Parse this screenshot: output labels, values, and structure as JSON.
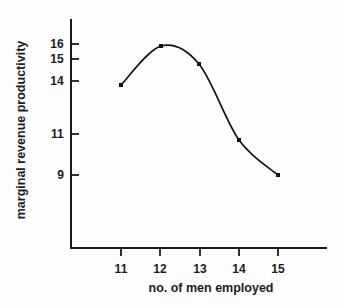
{
  "chart_data": {
    "type": "line",
    "title": "",
    "xlabel": "no. of men employed",
    "ylabel": "marginal revenue productivity",
    "x": [
      11,
      12,
      13,
      14,
      15
    ],
    "values": [
      14,
      16,
      15,
      11,
      9
    ],
    "series": [
      {
        "name": "marginal revenue productivity",
        "x": [
          11,
          12,
          13,
          14,
          15
        ],
        "values": [
          14,
          16,
          15,
          11,
          9
        ]
      }
    ],
    "xticks": [
      "11",
      "12",
      "13",
      "14",
      "15"
    ],
    "yticks": [
      "16",
      "15",
      "14",
      "11",
      "9"
    ],
    "xlim": [
      10.4,
      16.5
    ],
    "ylim": [
      6.0,
      17.2
    ],
    "grid": false,
    "legend": false,
    "markers": "filled-square",
    "line_color": "#111111",
    "marker_color": "#111111",
    "axis_color": "#1a1a1a",
    "background_color": "#fdfdfd",
    "smoothing": "curved"
  },
  "axes": {
    "y_ticks": [
      {
        "label": "16",
        "y": 44
      },
      {
        "label": "15",
        "y": 59
      },
      {
        "label": "14",
        "y": 81
      },
      {
        "label": "11",
        "y": 134
      },
      {
        "label": "9",
        "y": 175
      }
    ],
    "x_ticks": [
      {
        "label": "11",
        "x": 121
      },
      {
        "label": "12",
        "x": 160
      },
      {
        "label": "13",
        "x": 200
      },
      {
        "label": "14",
        "x": 239
      },
      {
        "label": "15",
        "x": 278
      }
    ]
  },
  "points": [
    {
      "label": "11",
      "value": "14",
      "px": 121,
      "py": 85
    },
    {
      "label": "12",
      "value": "16",
      "px": 161,
      "py": 46
    },
    {
      "label": "13",
      "value": "15",
      "px": 199,
      "py": 64
    },
    {
      "label": "14",
      "value": "11",
      "px": 239,
      "py": 140
    },
    {
      "label": "15",
      "value": "9",
      "px": 278,
      "py": 175
    }
  ]
}
